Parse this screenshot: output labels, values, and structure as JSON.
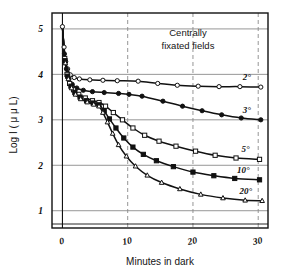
{
  "figure": {
    "background": "#ffffff",
    "ink": "#111111",
    "grid_color": "#8a8a8a",
    "frame_color": "#111111"
  },
  "annotation": {
    "line1": "Centrally",
    "line2": "fixated fields"
  },
  "chart_data": {
    "type": "line",
    "title": "",
    "subtitle": "",
    "xlabel": "Minutes in dark",
    "ylabel": "Log I ( μ μ L)",
    "xlim": [
      -1.6,
      31.5
    ],
    "ylim": [
      0.62,
      5.35
    ],
    "xticks": [
      0,
      10,
      20,
      30
    ],
    "xticklabels": [
      "0",
      "10",
      "20",
      "30"
    ],
    "yticks": [
      1,
      2,
      3,
      4,
      5
    ],
    "yticklabels": [
      "1",
      "2",
      "3",
      "4",
      "5"
    ],
    "grid": true,
    "grid_style": "solid horizontal, dashed vertical",
    "legend": "inline curve end labels",
    "legend_position": "right of each curve",
    "series": [
      {
        "name": "2°",
        "label": "2°",
        "marker": "open-circle",
        "marker_fill": "#ffffff",
        "color": "#111111",
        "points": [
          [
            0.0,
            5.05
          ],
          [
            0.25,
            4.6
          ],
          [
            0.5,
            4.28
          ],
          [
            0.8,
            4.12
          ],
          [
            1.2,
            3.99
          ],
          [
            1.8,
            3.93
          ],
          [
            2.6,
            3.9
          ],
          [
            4.2,
            3.88
          ],
          [
            6.2,
            3.87
          ],
          [
            8.4,
            3.86
          ],
          [
            11.6,
            3.85
          ],
          [
            14.6,
            3.8
          ],
          [
            17.6,
            3.76
          ],
          [
            20.8,
            3.74
          ],
          [
            24.0,
            3.73
          ],
          [
            27.2,
            3.73
          ],
          [
            30.4,
            3.72
          ]
        ]
      },
      {
        "name": "3°",
        "label": "3°",
        "marker": "filled-circle",
        "marker_fill": "#111111",
        "color": "#111111",
        "points": [
          [
            0.0,
            5.05
          ],
          [
            0.3,
            4.45
          ],
          [
            0.6,
            4.12
          ],
          [
            1.0,
            3.9
          ],
          [
            1.5,
            3.78
          ],
          [
            2.2,
            3.7
          ],
          [
            3.2,
            3.65
          ],
          [
            4.6,
            3.62
          ],
          [
            6.4,
            3.6
          ],
          [
            8.6,
            3.58
          ],
          [
            10.2,
            3.56
          ],
          [
            12.2,
            3.52
          ],
          [
            15.4,
            3.41
          ],
          [
            18.4,
            3.3
          ],
          [
            21.4,
            3.2
          ],
          [
            24.4,
            3.11
          ],
          [
            27.4,
            3.04
          ],
          [
            30.4,
            3.0
          ]
        ]
      },
      {
        "name": "5°",
        "label": "5°",
        "marker": "open-square",
        "marker_fill": "#ffffff",
        "color": "#111111",
        "points": [
          [
            0.0,
            5.05
          ],
          [
            0.35,
            4.35
          ],
          [
            0.7,
            4.0
          ],
          [
            1.1,
            3.8
          ],
          [
            1.7,
            3.66
          ],
          [
            2.5,
            3.56
          ],
          [
            3.5,
            3.48
          ],
          [
            4.6,
            3.42
          ],
          [
            5.6,
            3.38
          ],
          [
            6.6,
            3.3
          ],
          [
            7.8,
            3.16
          ],
          [
            9.2,
            3.0
          ],
          [
            10.8,
            2.82
          ],
          [
            12.6,
            2.66
          ],
          [
            14.8,
            2.53
          ],
          [
            17.4,
            2.42
          ],
          [
            20.4,
            2.31
          ],
          [
            23.4,
            2.22
          ],
          [
            26.6,
            2.16
          ],
          [
            30.2,
            2.13
          ]
        ]
      },
      {
        "name": "10°",
        "label": "10°",
        "marker": "filled-square",
        "marker_fill": "#111111",
        "color": "#111111",
        "points": [
          [
            0.0,
            5.05
          ],
          [
            0.4,
            4.3
          ],
          [
            0.8,
            3.96
          ],
          [
            1.3,
            3.74
          ],
          [
            1.9,
            3.6
          ],
          [
            2.7,
            3.5
          ],
          [
            3.7,
            3.42
          ],
          [
            4.7,
            3.37
          ],
          [
            5.6,
            3.33
          ],
          [
            6.4,
            3.2
          ],
          [
            7.2,
            3.02
          ],
          [
            8.2,
            2.82
          ],
          [
            9.4,
            2.6
          ],
          [
            10.8,
            2.4
          ],
          [
            12.4,
            2.24
          ],
          [
            14.4,
            2.1
          ],
          [
            17.0,
            1.97
          ],
          [
            20.0,
            1.85
          ],
          [
            23.2,
            1.77
          ],
          [
            26.4,
            1.71
          ],
          [
            30.2,
            1.68
          ]
        ]
      },
      {
        "name": "20°",
        "label": "20°",
        "marker": "open-triangle",
        "marker_fill": "#ffffff",
        "color": "#111111",
        "points": [
          [
            0.0,
            5.05
          ],
          [
            0.45,
            4.25
          ],
          [
            0.9,
            3.9
          ],
          [
            1.4,
            3.7
          ],
          [
            2.0,
            3.56
          ],
          [
            2.8,
            3.46
          ],
          [
            3.8,
            3.39
          ],
          [
            4.8,
            3.34
          ],
          [
            5.6,
            3.3
          ],
          [
            6.2,
            3.16
          ],
          [
            6.9,
            2.95
          ],
          [
            7.7,
            2.7
          ],
          [
            8.6,
            2.45
          ],
          [
            9.8,
            2.2
          ],
          [
            11.2,
            1.98
          ],
          [
            13.0,
            1.78
          ],
          [
            15.2,
            1.62
          ],
          [
            18.0,
            1.48
          ],
          [
            21.2,
            1.36
          ],
          [
            24.6,
            1.28
          ],
          [
            28.0,
            1.23
          ],
          [
            30.6,
            1.22
          ]
        ]
      }
    ]
  }
}
